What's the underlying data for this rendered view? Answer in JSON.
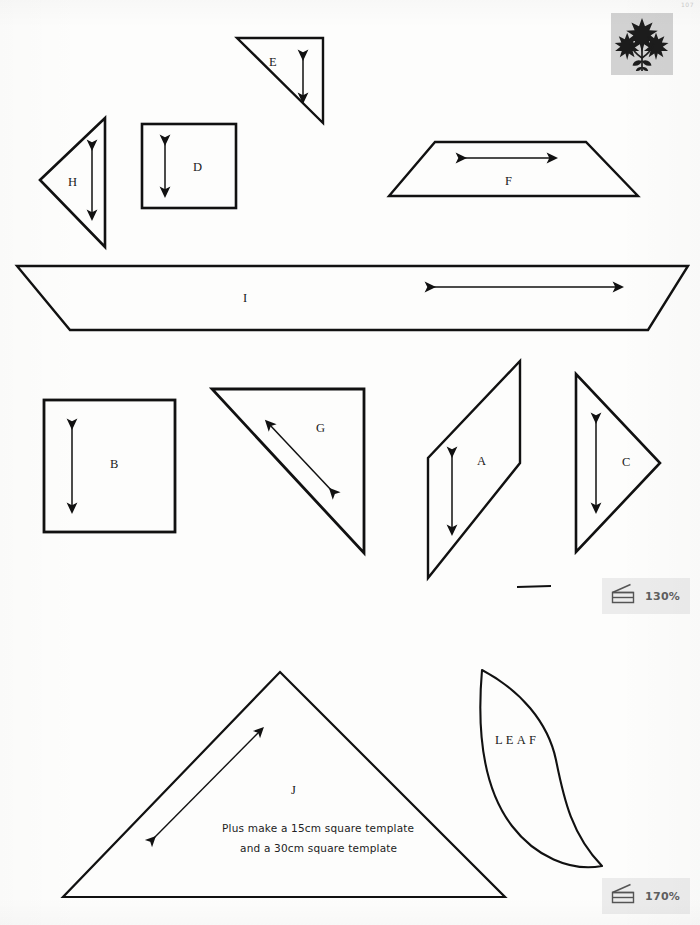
{
  "page": {
    "background_color": "#fdfdfc",
    "ink_color": "#111111",
    "width": 700,
    "height": 925,
    "corner_code": "107"
  },
  "logo": {
    "name": "flower-star-logo",
    "box_color": "#d2d2d2",
    "motif_color": "#1c1c1c",
    "description": "three eight-pointed stars on stems with leaves"
  },
  "templates": [
    {
      "id": "E",
      "label": "E",
      "kind": "right-triangle",
      "grain_arrow": "vertical",
      "label_x": 269,
      "label_y": 55
    },
    {
      "id": "H",
      "label": "H",
      "kind": "triangle-pointing-left",
      "grain_arrow": "vertical",
      "label_x": 68,
      "label_y": 176
    },
    {
      "id": "D",
      "label": "D",
      "kind": "square",
      "grain_arrow": "vertical",
      "label_x": 193,
      "label_y": 162
    },
    {
      "id": "F",
      "label": "F",
      "kind": "trapezoid",
      "grain_arrow": "horizontal",
      "label_x": 505,
      "label_y": 177
    },
    {
      "id": "I",
      "label": "I",
      "kind": "wide-trapezoid",
      "grain_arrow": "horizontal",
      "label_x": 243,
      "label_y": 294
    },
    {
      "id": "B",
      "label": "B",
      "kind": "square",
      "grain_arrow": "vertical",
      "label_x": 110,
      "label_y": 459
    },
    {
      "id": "G",
      "label": "G",
      "kind": "right-triangle",
      "grain_arrow": "diagonal",
      "label_x": 316,
      "label_y": 426
    },
    {
      "id": "A",
      "label": "A",
      "kind": "parallelogram",
      "label_x": 477,
      "label_y": 458
    },
    {
      "id": "C",
      "label": "C",
      "kind": "triangle-pointing-right",
      "grain_arrow": "vertical",
      "label_x": 622,
      "label_y": 458
    },
    {
      "id": "J",
      "label": "J",
      "kind": "large-triangle",
      "grain_arrow": "diagonal",
      "label_x": 290,
      "label_y": 788
    },
    {
      "id": "LEAF",
      "label": "LEAF",
      "kind": "leaf-curve",
      "label_x": 495,
      "label_y": 740
    }
  ],
  "notes": {
    "line1": "Plus make a 15cm square template",
    "line2": "and a 30cm square template",
    "line1_x": 230,
    "line1_y": 825,
    "line2_x": 247,
    "line2_y": 845
  },
  "scale_badges": [
    {
      "name": "enlarge-130",
      "percent": "130%",
      "icon": "copier-icon"
    },
    {
      "name": "enlarge-170",
      "percent": "170%",
      "icon": "copier-icon"
    }
  ],
  "rule_mark": {
    "name": "measurement-rule-mark",
    "x1": 517,
    "y1": 587,
    "x2": 551,
    "y2": 586
  }
}
